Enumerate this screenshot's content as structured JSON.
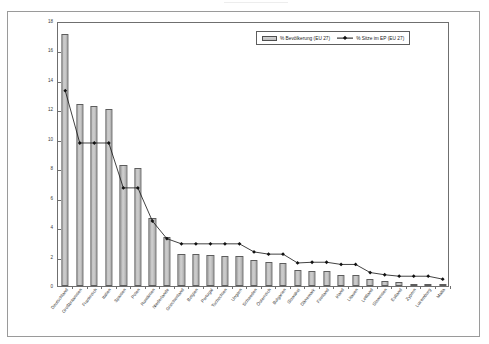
{
  "chart_data": {
    "type": "bar",
    "title": "",
    "subtitle": "",
    "xlabel": "",
    "ylabel": "",
    "ylim": [
      0,
      18
    ],
    "ytick_step": 2,
    "yticks": [
      0,
      2,
      4,
      6,
      8,
      10,
      12,
      14,
      16,
      18
    ],
    "grid": false,
    "legend_position": "top-right",
    "categories": [
      "Deutschland",
      "Großbritannien",
      "Frankreich",
      "Italien",
      "Spanien",
      "Polen",
      "Rumänien",
      "Niederlande",
      "Griechenland",
      "Belgien",
      "Portugal",
      "Tschechien",
      "Ungarn",
      "Schweden",
      "Österreich",
      "Bulgarien",
      "Slowakei",
      "Dänemark",
      "Finnland",
      "Irland",
      "Litauen",
      "Lettland",
      "Slowenien",
      "Estland",
      "Zypern",
      "Luxemburg",
      "Malta"
    ],
    "series": [
      {
        "name": "% Bevölkerung (EU 27)",
        "type": "bar",
        "values": [
          17.1,
          12.35,
          12.2,
          12.0,
          8.2,
          8.0,
          4.6,
          3.35,
          2.2,
          2.15,
          2.1,
          2.05,
          2.05,
          1.8,
          1.65,
          1.55,
          1.1,
          1.05,
          1.05,
          0.75,
          0.75,
          0.5,
          0.35,
          0.25,
          0.12,
          0.08,
          0.07
        ]
      },
      {
        "name": "% Sitze im EP (EU 27)",
        "type": "line",
        "marker": "diamond",
        "values": [
          13.4,
          9.85,
          9.85,
          9.85,
          6.8,
          6.8,
          4.55,
          3.35,
          3.0,
          3.0,
          3.0,
          3.0,
          3.0,
          2.45,
          2.3,
          2.3,
          1.7,
          1.75,
          1.75,
          1.6,
          1.6,
          1.05,
          0.9,
          0.8,
          0.8,
          0.8,
          0.6
        ]
      }
    ]
  },
  "legend": {
    "entries": [
      {
        "label": "% Bevölkerung (EU 27)",
        "marker": "bar-swatch"
      },
      {
        "label": "% Sitze im EP (EU 27)",
        "marker": "line-diamond-swatch"
      }
    ]
  },
  "colors": {
    "bar_fill": "#cdcdcd",
    "bar_border": "#5d5d5d",
    "line": "#111111",
    "marker": "#111111",
    "axis": "#6f6f6f",
    "frame": "#9a9a9a",
    "text": "#2f2f2f",
    "background": "#ffffff"
  }
}
